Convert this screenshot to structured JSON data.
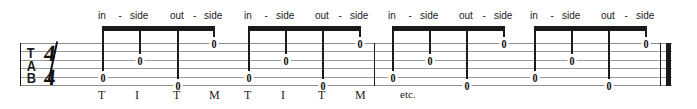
{
  "notation": {
    "type": "guitar-tablature",
    "clef_label": "TAB",
    "clef_letters": [
      "T",
      "A",
      "B"
    ],
    "time_signature": {
      "numerator": "4",
      "denominator": "4",
      "display": "4/4"
    },
    "string_count": 6,
    "measure_count": 4,
    "trailing_text": "etc."
  },
  "staff": {
    "left": 20,
    "right": 672,
    "top": 43,
    "line_spacing": 8.4,
    "line_color": "#9a9a9a"
  },
  "barlines": [
    {
      "name": "staff-start",
      "x": 20,
      "kind": "thin"
    },
    {
      "name": "mid-barline",
      "x": 374,
      "kind": "thin"
    },
    {
      "name": "final-thin",
      "x": 660,
      "kind": "thin"
    },
    {
      "name": "final-thick",
      "x": 666,
      "kind": "thick"
    }
  ],
  "measures": [
    {
      "index": 1,
      "lyrics": [
        "in",
        "-",
        "side",
        "out",
        "-",
        "side"
      ],
      "fingering": [
        "T",
        "I",
        "T",
        "M"
      ],
      "show_fingering": true,
      "beam": {
        "x": 102,
        "width": 113,
        "y": 26
      },
      "notes": [
        {
          "fret": "0",
          "string": 5,
          "x": 102
        },
        {
          "fret": "0",
          "string": 3,
          "x": 139
        },
        {
          "fret": "0",
          "string": 6,
          "x": 177
        },
        {
          "fret": "0",
          "string": 1,
          "x": 213
        }
      ]
    },
    {
      "index": 2,
      "lyrics": [
        "in",
        "-",
        "side",
        "out",
        "-",
        "side"
      ],
      "fingering": [
        "T",
        "I",
        "T",
        "M"
      ],
      "show_fingering": true,
      "beam": {
        "x": 248,
        "width": 113,
        "y": 26
      },
      "notes": [
        {
          "fret": "0",
          "string": 5,
          "x": 248
        },
        {
          "fret": "0",
          "string": 3,
          "x": 285
        },
        {
          "fret": "0",
          "string": 6,
          "x": 322
        },
        {
          "fret": "0",
          "string": 1,
          "x": 359
        }
      ]
    },
    {
      "index": 3,
      "lyrics": [
        "in",
        "-",
        "side",
        "out",
        "-",
        "side"
      ],
      "fingering": [],
      "show_fingering": false,
      "beam": {
        "x": 392,
        "width": 113,
        "y": 26
      },
      "notes": [
        {
          "fret": "0",
          "string": 5,
          "x": 392
        },
        {
          "fret": "0",
          "string": 3,
          "x": 429
        },
        {
          "fret": "0",
          "string": 6,
          "x": 466
        },
        {
          "fret": "0",
          "string": 1,
          "x": 503
        }
      ]
    },
    {
      "index": 4,
      "lyrics": [
        "in",
        "-",
        "side",
        "out",
        "-",
        "side"
      ],
      "fingering": [],
      "show_fingering": false,
      "beam": {
        "x": 534,
        "width": 113,
        "y": 26
      },
      "notes": [
        {
          "fret": "0",
          "string": 5,
          "x": 534
        },
        {
          "fret": "0",
          "string": 3,
          "x": 571
        },
        {
          "fret": "0",
          "string": 6,
          "x": 608
        },
        {
          "fret": "0",
          "string": 1,
          "x": 645
        }
      ]
    }
  ],
  "etc_label": {
    "text": "etc.",
    "x": 400,
    "y": 88
  }
}
